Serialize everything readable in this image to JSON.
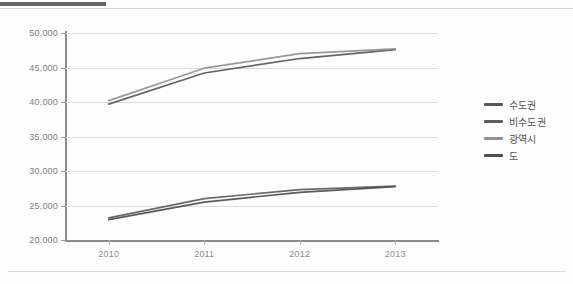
{
  "figure": {
    "top_rule": "dark-rule",
    "bottom_rule": "light-rule"
  },
  "legend": {
    "position": "right",
    "items": [
      {
        "label": "수도권",
        "color": "#595959"
      },
      {
        "label": "비수도권",
        "color": "#5e5e5e"
      },
      {
        "label": "광역시",
        "color": "#919191"
      },
      {
        "label": "도",
        "color": "#4f4f4f"
      }
    ]
  },
  "axes": {
    "y_ticks": [
      "50,000",
      "45,000",
      "40,000",
      "35,000",
      "30,000",
      "25,000",
      "20,000"
    ],
    "x_ticks": [
      "2010",
      "2011",
      "2012",
      "2013"
    ]
  },
  "chart_data": {
    "type": "line",
    "title": "",
    "subtitle": "",
    "xlabel": "",
    "ylabel": "",
    "categories": [
      "2010",
      "2011",
      "2012",
      "2013"
    ],
    "x": [
      2010,
      2011,
      2012,
      2013
    ],
    "ylim": [
      20000,
      50000
    ],
    "ytick_values": [
      50000,
      45000,
      40000,
      35000,
      30000,
      25000,
      20000
    ],
    "grid": true,
    "legend_position": "right",
    "series": [
      {
        "name": "수도권",
        "color": "#595959",
        "values": [
          39700,
          44200,
          46300,
          47600
        ]
      },
      {
        "name": "비수도권",
        "color": "#5e5e5e",
        "values": [
          23200,
          26000,
          27300,
          27800
        ]
      },
      {
        "name": "광역시",
        "color": "#919191",
        "values": [
          40200,
          44900,
          47000,
          47700
        ]
      },
      {
        "name": "도",
        "color": "#4f4f4f",
        "values": [
          22950,
          25500,
          26900,
          27750
        ]
      }
    ]
  }
}
